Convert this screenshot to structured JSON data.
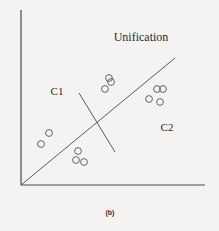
{
  "figure": {
    "caption": "(b)",
    "title": "Unification",
    "cluster_labels": [
      {
        "label": "C1",
        "x": 57,
        "y": 95
      },
      {
        "label": "C2",
        "x": 167,
        "y": 131
      }
    ],
    "colors": {
      "line": "#5a5a5a",
      "axis": "#4a4a4a",
      "point_stroke": "#555555",
      "background": "#f4f3f1"
    }
  },
  "chart_data": {
    "type": "scatter",
    "title": "Unification",
    "caption": "(b)",
    "xlabel": "",
    "ylabel": "",
    "grid": false,
    "annotations": [
      "C1",
      "C2"
    ],
    "axes": {
      "origin": [
        21,
        185
      ],
      "x_end": 205,
      "y_end": 10
    },
    "lines": [
      {
        "name": "separator-diagonal",
        "x1": 21,
        "y1": 185,
        "x2": 175,
        "y2": 58
      },
      {
        "name": "perpendicular-split",
        "x1": 79,
        "y1": 93,
        "x2": 115,
        "y2": 152
      }
    ],
    "series": [
      {
        "name": "points",
        "points": [
          {
            "x": 109,
            "y": 78
          },
          {
            "x": 111,
            "y": 82
          },
          {
            "x": 105,
            "y": 89
          },
          {
            "x": 157,
            "y": 89
          },
          {
            "x": 163,
            "y": 89
          },
          {
            "x": 149,
            "y": 99
          },
          {
            "x": 160,
            "y": 102
          },
          {
            "x": 49,
            "y": 133
          },
          {
            "x": 41,
            "y": 144
          },
          {
            "x": 78,
            "y": 151
          },
          {
            "x": 76,
            "y": 160
          },
          {
            "x": 84,
            "y": 162
          }
        ]
      }
    ]
  }
}
